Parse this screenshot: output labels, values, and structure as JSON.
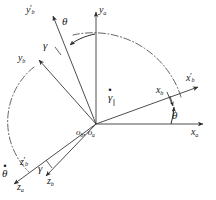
{
  "figure": {
    "background": "#ffffff",
    "stroke_color": "#3a3a3a",
    "text_color": "#1a1a1a",
    "width": 216,
    "height": 200
  },
  "origin": {
    "x": 96,
    "y": 124,
    "label_b": "o",
    "label_b_sub": "b",
    "label_sep": ",",
    "label_a": "o",
    "label_a_sub": "a",
    "label_full": "ob, oa"
  },
  "axes": [
    {
      "name": "ya-axis",
      "label_base": "y",
      "label_sub": "a",
      "prime": "",
      "x1": 96,
      "y1": 124,
      "x2": 96,
      "y2": 10,
      "style": "solid-arrow"
    },
    {
      "name": "xa-axis",
      "label_base": "x",
      "label_sub": "a",
      "prime": "",
      "x1": 96,
      "y1": 124,
      "x2": 205,
      "y2": 124,
      "style": "solid-arrow"
    },
    {
      "name": "za-axis",
      "label_base": "z",
      "label_sub": "a",
      "prime": "",
      "x1": 96,
      "y1": 124,
      "x2": 12,
      "y2": 186,
      "style": "solid-arrow"
    },
    {
      "name": "xb-prime-axis",
      "label_base": "x",
      "label_sub": "b",
      "prime": "′",
      "x1": 96,
      "y1": 124,
      "x2": 200,
      "y2": 86,
      "style": "solid-arrow"
    },
    {
      "name": "yb-prime-axis",
      "label_base": "y",
      "label_sub": "b",
      "prime": "′",
      "x1": 96,
      "y1": 124,
      "x2": 52,
      "y2": 14,
      "style": "solid-arrow"
    },
    {
      "name": "zb-prime-axis",
      "label_base": "z",
      "label_sub": "b",
      "prime": "′",
      "x1": 96,
      "y1": 124,
      "x2": 12,
      "y2": 186,
      "style": "solid-arrow"
    },
    {
      "name": "yb-axis",
      "label_base": "y",
      "label_sub": "b",
      "prime": "",
      "x1": 96,
      "y1": 124,
      "x2": 38,
      "y2": 58,
      "style": "solid-arrow"
    },
    {
      "name": "zb-axis",
      "label_base": "z",
      "label_sub": "b",
      "prime": "",
      "x1": 96,
      "y1": 124,
      "x2": 44,
      "y2": 178,
      "style": "solid-arrow"
    },
    {
      "name": "xb-axis",
      "label_base": "x",
      "label_sub": "b",
      "prime": "",
      "x1": 96,
      "y1": 124,
      "x2": 172,
      "y2": 96,
      "style": "tick-marker"
    }
  ],
  "angles": [
    {
      "name": "theta-top",
      "symbol": "θ",
      "dotted": false,
      "x": 66,
      "y": 22,
      "description": "rotation angle between ya and yb-prime"
    },
    {
      "name": "theta-right",
      "symbol": "θ",
      "dotted": false,
      "x": 176,
      "y": 113,
      "description": "rotation angle between xa and xb-prime"
    },
    {
      "name": "gamma-upper",
      "symbol": "γ",
      "dotted": false,
      "x": 46,
      "y": 44,
      "description": "rotation angle between yb-prime and yb"
    },
    {
      "name": "gamma-lower",
      "symbol": "γ",
      "dotted": false,
      "x": 39,
      "y": 167,
      "description": "rotation angle between zb-prime and zb"
    },
    {
      "name": "gamma-dot-rate",
      "symbol": "γ",
      "dotted": true,
      "x": 110,
      "y": 95,
      "description": "angular rate gamma-dot along xb axis"
    },
    {
      "name": "theta-dot-rate",
      "symbol": "θ",
      "dotted": true,
      "x": 4,
      "y": 170,
      "description": "angular rate theta-dot along za axis"
    }
  ],
  "arcs": [
    {
      "name": "theta-dashdot-arc",
      "description": "dash-dot arc from xb-prime to yb-prime showing theta sweep",
      "style": "dash-dot"
    },
    {
      "name": "gamma-dashdot-arc",
      "description": "dash-dot arc from yb to zb-prime showing gamma sweep",
      "style": "dash-dot"
    },
    {
      "name": "theta-curved-arrow",
      "description": "small curved arrow at top near theta symbol",
      "style": "solid-arrow"
    },
    {
      "name": "theta-angle-arc-right",
      "description": "small arc between xa and xb-prime near theta",
      "style": "solid-arrow"
    }
  ]
}
